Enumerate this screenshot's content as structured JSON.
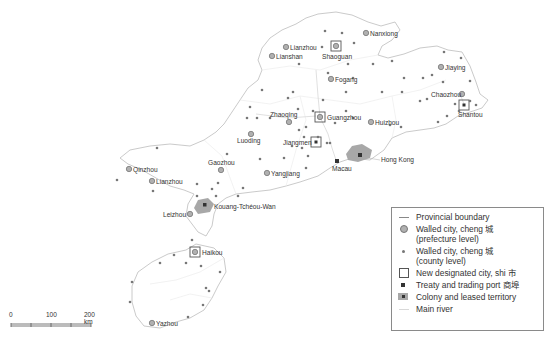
{
  "map": {
    "title": "Guangdong province: walled cities, designated cities, treaty ports and colonies",
    "prefecture_cities": [
      {
        "name": "Nanxiong",
        "x": 366,
        "y": 33,
        "label_side": "right"
      },
      {
        "name": "Lianzhou",
        "x": 286,
        "y": 47,
        "label_side": "right"
      },
      {
        "name": "Lianshan",
        "x": 272,
        "y": 56,
        "label_side": "right"
      },
      {
        "name": "Shaoguan",
        "x": 336,
        "y": 46,
        "label_side": "below",
        "shi": true
      },
      {
        "name": "Fogang",
        "x": 331,
        "y": 79,
        "label_side": "right"
      },
      {
        "name": "Jiaying",
        "x": 441,
        "y": 67,
        "label_side": "right"
      },
      {
        "name": "Chaozhou",
        "x": 462,
        "y": 94,
        "label_side": "left"
      },
      {
        "name": "Zhaoqing",
        "x": 289,
        "y": 122,
        "label_side": "above"
      },
      {
        "name": "Guangzhou",
        "x": 320,
        "y": 117,
        "label_side": "right",
        "shi": true
      },
      {
        "name": "Huizhou",
        "x": 371,
        "y": 122,
        "label_side": "right"
      },
      {
        "name": "Luoding",
        "x": 251,
        "y": 134,
        "label_side": "below"
      },
      {
        "name": "Yangjiang",
        "x": 267,
        "y": 173,
        "label_side": "right"
      },
      {
        "name": "Gaozhou",
        "x": 221,
        "y": 170,
        "label_side": "above"
      },
      {
        "name": "Qinzhou",
        "x": 129,
        "y": 169,
        "label_side": "right"
      },
      {
        "name": "Lianzhou",
        "x": 152,
        "y": 181,
        "label_side": "right"
      },
      {
        "name": "Leizhou",
        "x": 190,
        "y": 214,
        "label_side": "left"
      },
      {
        "name": "Haikou",
        "x": 195,
        "y": 252,
        "label_side": "right",
        "shi": true
      },
      {
        "name": "Yazhou",
        "x": 152,
        "y": 323,
        "label_side": "right"
      }
    ],
    "shi_cities": [
      {
        "name": "Jiangmen",
        "x": 316,
        "y": 142,
        "label_side": "left"
      },
      {
        "name": "Shantou",
        "x": 464,
        "y": 105,
        "label_side": "below"
      }
    ],
    "colonies": [
      {
        "name": "Hong Kong",
        "x": 360,
        "y": 157
      },
      {
        "name": "Macau",
        "x": 337,
        "y": 161
      },
      {
        "name": "Kouang-Tchéou-Wan",
        "x": 204,
        "y": 205
      }
    ]
  },
  "legend": {
    "items": [
      {
        "symbol": "line",
        "label": "Provincial boundary"
      },
      {
        "symbol": "prefecture",
        "label": "Walled city, cheng 城",
        "label2": "(prefecture level)"
      },
      {
        "symbol": "county",
        "label": "Walled city, cheng 城",
        "label2": "(county level)"
      },
      {
        "symbol": "shi",
        "label": "New designated city, shi 市"
      },
      {
        "symbol": "port",
        "label": "Treaty and trading port 商埠"
      },
      {
        "symbol": "colony",
        "label": "Colony and leased territory"
      },
      {
        "symbol": "river",
        "label": "Main river"
      }
    ]
  },
  "scale_bar": {
    "ticks": [
      "0",
      "100",
      "200 km"
    ]
  },
  "colors": {
    "boundary": "#bdbdbd",
    "prefecture_fill": "#b0b0b0",
    "county_dot": "#777777",
    "colony_fill": "#a8a8a8",
    "text": "#333333"
  }
}
